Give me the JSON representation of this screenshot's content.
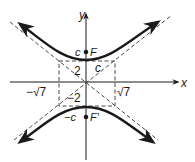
{
  "diagram": {
    "type": "hyperbola",
    "orientation": "vertical",
    "axes": {
      "x_label": "x",
      "y_label": "y"
    },
    "box_labels": {
      "a_pos": "2",
      "a_neg": "−2",
      "b_pos": "√7",
      "b_neg": "−√7",
      "diag": "c"
    },
    "foci": {
      "upper": {
        "name": "F",
        "coord_label": "c"
      },
      "lower": {
        "name": "F′",
        "coord_label": "−c"
      }
    },
    "colors": {
      "stroke": "#1a1a1a",
      "dashed": "#333333",
      "background": "#ffffff"
    }
  }
}
